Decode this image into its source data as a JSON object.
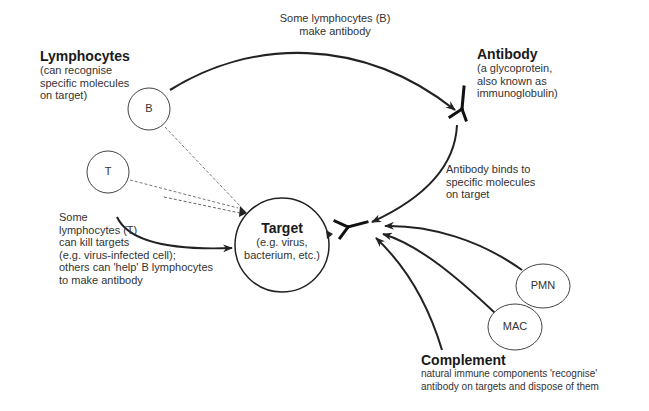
{
  "lymphocytes": {
    "title": "Lymphocytes",
    "desc": [
      "(can recognise",
      "specific molecules",
      "on target)"
    ]
  },
  "b_to_antibody_caption": [
    "Some lymphocytes (B)",
    "make antibody"
  ],
  "antibody": {
    "title": "Antibody",
    "desc": [
      "(a glycoprotein,",
      "also known as",
      "immunoglobulin)"
    ]
  },
  "antibody_binds_caption": [
    "Antibody binds to",
    "specific molecules",
    "on target"
  ],
  "t_caption": [
    "Some",
    "lymphocytes (T)",
    "can kill targets",
    "(e.g. virus-infected cell);",
    "others can 'help' B lymphocytes",
    "to make antibody"
  ],
  "target": {
    "title": "Target",
    "desc": [
      "(e.g. virus,",
      "bacterium, etc.)"
    ]
  },
  "nodes": {
    "b": "B",
    "t": "T",
    "pmn": "PMN",
    "mac": "MAC"
  },
  "complement": {
    "title": "Complement",
    "desc": [
      "natural immune components 'recognise'",
      "antibody on targets and dispose of them"
    ]
  }
}
